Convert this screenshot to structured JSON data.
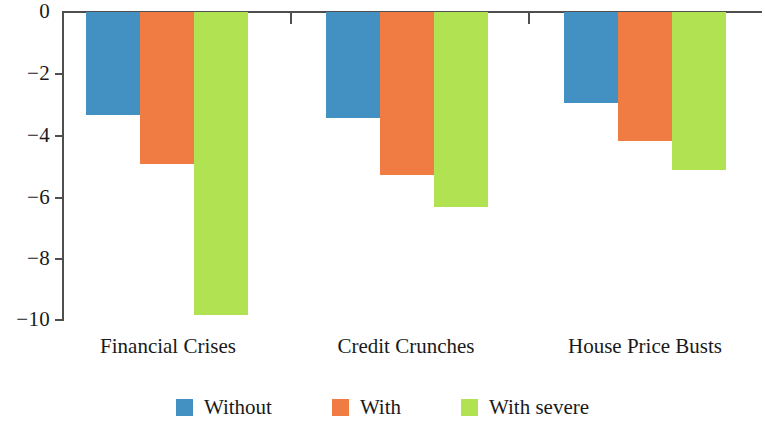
{
  "chart_data": {
    "type": "bar",
    "title": "",
    "subtitle": "",
    "xlabel": "",
    "ylabel": "",
    "categories": [
      "Financial Crises",
      "Credit Crunches",
      "House Price Busts"
    ],
    "series": [
      {
        "name": "Without",
        "color": "#4390c2",
        "values": [
          -3.35,
          -3.45,
          -2.95
        ]
      },
      {
        "name": "With",
        "color": "#f07c44",
        "values": [
          -4.95,
          -5.3,
          -4.2
        ]
      },
      {
        "name": "With severe",
        "color": "#b0e252",
        "values": [
          -9.85,
          -6.35,
          -5.15
        ]
      }
    ],
    "ylim": [
      -10,
      0
    ],
    "y_ticks": [
      0,
      -2,
      -4,
      -6,
      -8,
      -10
    ],
    "y_tick_labels": [
      "0",
      "−2",
      "−4",
      "−6",
      "−8",
      "−10"
    ],
    "grid": false,
    "legend_position": "bottom",
    "orientation": "vertical",
    "bars_direction": "downward"
  },
  "legend": {
    "items": [
      {
        "label": "Without",
        "color": "#4390c2"
      },
      {
        "label": "With",
        "color": "#f07c44"
      },
      {
        "label": "With severe",
        "color": "#b0e252"
      }
    ]
  },
  "axis": {
    "y_tick_labels": [
      "0",
      "−2",
      "−4",
      "−6",
      "−8",
      "−10"
    ]
  },
  "categories": [
    "Financial Crises",
    "Credit Crunches",
    "House Price Busts"
  ]
}
